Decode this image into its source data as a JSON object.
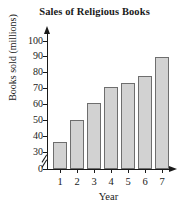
{
  "chart_data": {
    "type": "bar",
    "title": "Sales of Religious Books",
    "xlabel": "Year",
    "ylabel": "Books sold (millions)",
    "categories": [
      "1",
      "2",
      "3",
      "4",
      "5",
      "6",
      "7"
    ],
    "values": [
      36,
      50,
      61,
      71,
      73.5,
      78,
      90
    ],
    "ylim": [
      0,
      100
    ],
    "y_ticks": [
      0,
      30,
      40,
      50,
      60,
      70,
      80,
      90,
      100
    ],
    "y_tick_labels": [
      "0",
      "30",
      "40",
      "50",
      "60",
      "70",
      "80",
      "90",
      "100"
    ],
    "axis_break": {
      "present": true,
      "between": [
        0,
        30
      ],
      "symbol": "double-slash"
    },
    "grid": false,
    "legend": null,
    "bar_fill_color": "#d2d2d2",
    "bar_edge_color": "#6e6e6e",
    "axis_color": "#1a1a1a",
    "axis_arrows": [
      "y-up",
      "x-right"
    ]
  }
}
